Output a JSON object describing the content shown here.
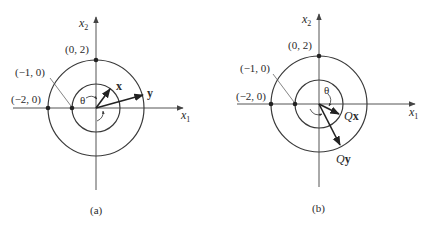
{
  "figure": {
    "colors": {
      "ink": "#222222",
      "axis": "#555555",
      "background": "#ffffff"
    },
    "panels": [
      {
        "id": "a",
        "caption": "(a)",
        "axis_x_label": "x",
        "axis_x_sub": "1",
        "axis_y_label": "x",
        "axis_y_sub": "2",
        "points": {
          "top": "(0, 2)",
          "inner_left": "(−1, 0)",
          "outer_left": "(−2, 0)"
        },
        "angle_label": "θ",
        "vectors": [
          {
            "name": "x",
            "label": "x",
            "bold": true
          },
          {
            "name": "y",
            "label": "y",
            "bold": true
          }
        ]
      },
      {
        "id": "b",
        "caption": "(b)",
        "axis_x_label": "x",
        "axis_x_sub": "1",
        "axis_y_label": "x",
        "axis_y_sub": "2",
        "points": {
          "top": "(0, 2)",
          "inner_left": "(−1, 0)",
          "outer_left": "(−2, 0)"
        },
        "angle_label": "θ",
        "vectors": [
          {
            "name": "Qx",
            "label_q": "Q",
            "label_v": "x"
          },
          {
            "name": "Qy",
            "label_q": "Q",
            "label_v": "y"
          }
        ]
      }
    ]
  }
}
